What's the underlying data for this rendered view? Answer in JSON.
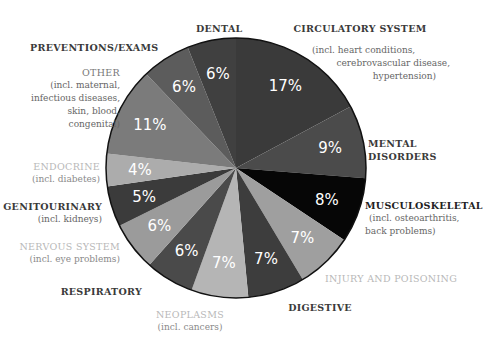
{
  "chart_data": {
    "type": "pie",
    "title": "",
    "start_angle_deg": 0,
    "direction": "clockwise",
    "slices": [
      {
        "key": "circulatory",
        "label": "CIRCULATORY SYSTEM",
        "sublabel": "(incl. heart conditions, cerebrovascular disease, hypertension)",
        "value": 17,
        "value_label": "17%",
        "color": "#3a3a3a"
      },
      {
        "key": "mental",
        "label": "MENTAL DISORDERS",
        "sublabel": "",
        "value": 9,
        "value_label": "9%",
        "color": "#4b4b4b"
      },
      {
        "key": "musculoskeletal",
        "label": "MUSCULOSKELETAL",
        "sublabel": "(incl. osteoarthritis, back problems)",
        "value": 8,
        "value_label": "8%",
        "color": "#060606"
      },
      {
        "key": "injury",
        "label": "INJURY AND POISONING",
        "sublabel": "",
        "value": 7,
        "value_label": "7%",
        "color": "#9f9f9f"
      },
      {
        "key": "digestive",
        "label": "DIGESTIVE",
        "sublabel": "",
        "value": 7,
        "value_label": "7%",
        "color": "#3d3d3d"
      },
      {
        "key": "neoplasms",
        "label": "NEOPLASMS",
        "sublabel": "(incl. cancers)",
        "value": 7,
        "value_label": "7%",
        "color": "#b5b5b5"
      },
      {
        "key": "respiratory",
        "label": "RESPIRATORY",
        "sublabel": "",
        "value": 6,
        "value_label": "6%",
        "color": "#4a4a4a"
      },
      {
        "key": "nervous",
        "label": "NERVOUS SYSTEM",
        "sublabel": "(incl. eye problems)",
        "value": 6,
        "value_label": "6%",
        "color": "#9b9b9b"
      },
      {
        "key": "genitourinary",
        "label": "GENITOURINARY",
        "sublabel": "(incl. kidneys)",
        "value": 5,
        "value_label": "5%",
        "color": "#3b3b3b"
      },
      {
        "key": "endocrine",
        "label": "ENDOCRINE",
        "sublabel": "(incl. diabetes)",
        "value": 4,
        "value_label": "4%",
        "color": "#acacac"
      },
      {
        "key": "other",
        "label": "OTHER",
        "sublabel": "(incl. maternal, infectious diseases, skin, blood, congenital)",
        "value": 11,
        "value_label": "11%",
        "color": "#7b7b7b"
      },
      {
        "key": "preventions",
        "label": "PREVENTIONS/EXAMS",
        "sublabel": "",
        "value": 6,
        "value_label": "6%",
        "color": "#5c5c5c"
      },
      {
        "key": "dental",
        "label": "DENTAL",
        "sublabel": "",
        "value": 6,
        "value_label": "6%",
        "color": "#404040"
      }
    ]
  },
  "labels": {
    "dental": {
      "title": "DENTAL"
    },
    "circulatory": {
      "title": "CIRCULATORY SYSTEM",
      "sub1": "(incl. heart conditions,",
      "sub2": "cerebrovascular disease,",
      "sub3": "hypertension)"
    },
    "preventions": {
      "title": "PREVENTIONS/EXAMS"
    },
    "other": {
      "title": "OTHER",
      "sub1": "(incl. maternal,",
      "sub2": "infectious diseases,",
      "sub3": "skin, blood,",
      "sub4": "congenital)"
    },
    "mental": {
      "title1": "MENTAL",
      "title2": "DISORDERS"
    },
    "endocrine": {
      "title": "ENDOCRINE",
      "sub1": "(incl. diabetes)"
    },
    "musculoskeletal": {
      "title": "MUSCULOSKELETAL",
      "sub1": "(incl. osteoarthritis,",
      "sub2": "back problems)"
    },
    "genitourinary": {
      "title": "GENITOURINARY",
      "sub1": "(incl. kidneys)"
    },
    "nervous": {
      "title": "NERVOUS SYSTEM",
      "sub1": "(incl. eye problems)"
    },
    "injury": {
      "title": "INJURY AND POISONING"
    },
    "respiratory": {
      "title": "RESPIRATORY"
    },
    "digestive": {
      "title": "DIGESTIVE"
    },
    "neoplasms": {
      "title": "NEOPLASMS",
      "sub1": "(incl. cancers)"
    }
  }
}
